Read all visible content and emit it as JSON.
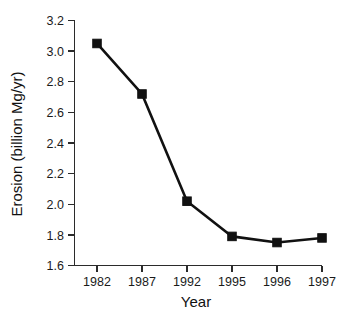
{
  "chart_data": {
    "type": "line",
    "title": "",
    "subtitle": "",
    "xlabel": "Year",
    "ylabel": "Erosion (billion Mg/yr)",
    "categories": [
      "1982",
      "1987",
      "1992",
      "1995",
      "1996",
      "1997"
    ],
    "values": [
      3.05,
      2.72,
      2.02,
      1.79,
      1.75,
      1.78
    ],
    "series": [
      {
        "name": "Erosion",
        "values": [
          3.05,
          2.72,
          2.02,
          1.79,
          1.75,
          1.78
        ]
      }
    ],
    "ylim": [
      1.6,
      3.2
    ],
    "ytick_labels": [
      "3.2",
      "3.0",
      "2.8",
      "2.6",
      "2.4",
      "2.2",
      "2.0",
      "1.8",
      "1.6"
    ],
    "ytick_values": [
      3.2,
      3.0,
      2.8,
      2.6,
      2.4,
      2.2,
      2.0,
      1.8,
      1.6
    ],
    "xtick_labels": [
      "1982",
      "1987",
      "1992",
      "1995",
      "1996",
      "1997"
    ],
    "grid": false,
    "legend": false,
    "legend_position": "none",
    "marker": "square",
    "line_color": "#111111",
    "marker_color": "#111111",
    "axis_color": "#2b2b2b",
    "background_color": "#ffffff",
    "annotations": []
  }
}
